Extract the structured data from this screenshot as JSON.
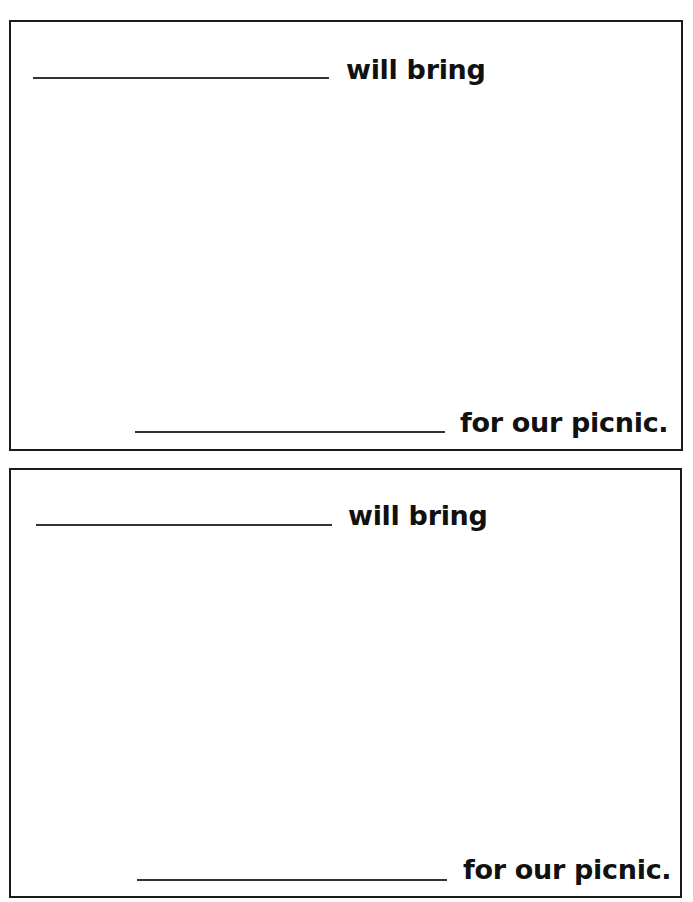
{
  "cards": [
    {
      "top_blank_label": "name blank",
      "top_text": "will bring",
      "bottom_blank_label": "item blank",
      "bottom_text": "for our picnic."
    },
    {
      "top_blank_label": "name blank",
      "top_text": "will bring",
      "bottom_blank_label": "item blank",
      "bottom_text": "for our picnic."
    }
  ]
}
